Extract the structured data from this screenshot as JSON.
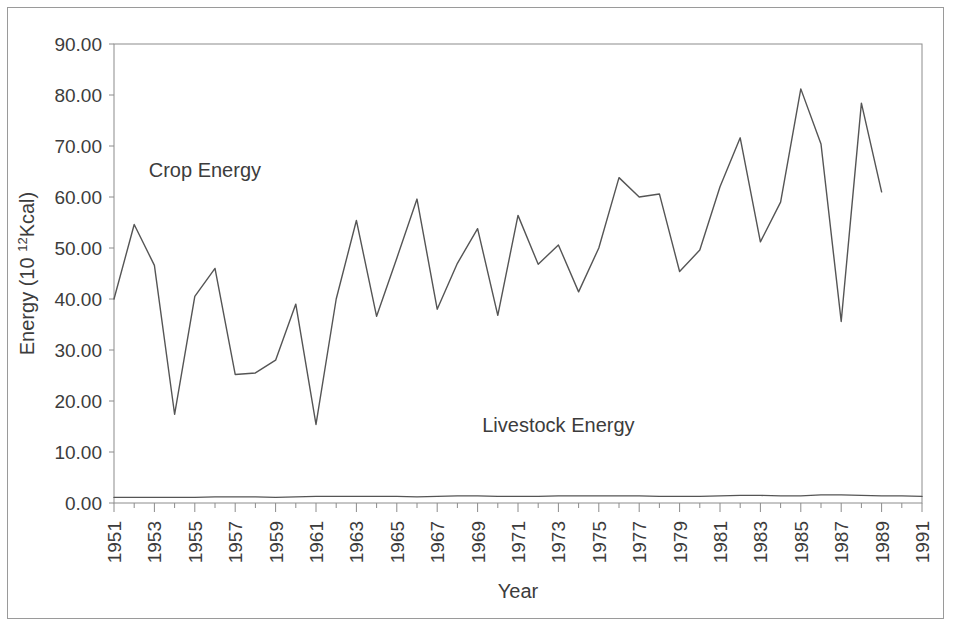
{
  "figure": {
    "frame_color": "#9a9a9a",
    "background": "#ffffff",
    "line_color": "#555555",
    "axis_color": "#8c8c8c",
    "text_color": "#3c3c3c"
  },
  "labels": {
    "crop_series_label": "Crop Energy",
    "livestock_series_label": "Livestock Energy",
    "xlabel": "Year",
    "ylabel_prefix": "Energy (10 ",
    "ylabel_superscript": "12",
    "ylabel_suffix": "Kcal)"
  },
  "chart_data": {
    "type": "line",
    "title": "",
    "xlabel": "Year",
    "ylabel": "Energy (10 12Kcal)",
    "xlim": [
      1951,
      1991
    ],
    "ylim": [
      0,
      90
    ],
    "grid": false,
    "legend": "inline-annotations",
    "ytick_labels": [
      "0.00",
      "10.00",
      "20.00",
      "30.00",
      "40.00",
      "50.00",
      "60.00",
      "70.00",
      "80.00",
      "90.00"
    ],
    "ytick_values": [
      0,
      10,
      20,
      30,
      40,
      50,
      60,
      70,
      80,
      90
    ],
    "xtick_labels": [
      "1951",
      "1953",
      "1955",
      "1957",
      "1959",
      "1961",
      "1963",
      "1965",
      "1967",
      "1969",
      "1971",
      "1973",
      "1975",
      "1977",
      "1979",
      "1981",
      "1983",
      "1985",
      "1987",
      "1989",
      "1991"
    ],
    "xtick_values": [
      1951,
      1953,
      1955,
      1957,
      1959,
      1961,
      1963,
      1965,
      1967,
      1969,
      1971,
      1973,
      1975,
      1977,
      1979,
      1981,
      1983,
      1985,
      1987,
      1989,
      1991
    ],
    "x": [
      1951,
      1952,
      1953,
      1954,
      1955,
      1956,
      1957,
      1958,
      1959,
      1960,
      1961,
      1962,
      1963,
      1964,
      1965,
      1966,
      1967,
      1968,
      1969,
      1970,
      1971,
      1972,
      1973,
      1974,
      1975,
      1976,
      1977,
      1978,
      1979,
      1980,
      1981,
      1982,
      1983,
      1984,
      1985,
      1986,
      1987,
      1988,
      1989,
      1990,
      1991
    ],
    "series": [
      {
        "name": "Crop Energy",
        "values": [
          40.0,
          54.6,
          46.6,
          17.4,
          40.5,
          46.0,
          25.2,
          25.5,
          28.0,
          39.0,
          15.4,
          40.0,
          55.4,
          36.6,
          48.0,
          59.6,
          38.0,
          47.0,
          53.8,
          36.8,
          56.4,
          46.8,
          50.6,
          41.4,
          50.0,
          63.8,
          60.0,
          60.6,
          45.4,
          49.6,
          62.0,
          71.6,
          51.2,
          59.0,
          81.2,
          70.4,
          35.6,
          78.4,
          61.0,
          0,
          0
        ],
        "annotation": "Crop Energy",
        "annotation_x": 1955.5,
        "annotation_y": 64.0
      },
      {
        "name": "Livestock Energy",
        "values": [
          1.1,
          1.1,
          1.1,
          1.1,
          1.1,
          1.2,
          1.2,
          1.2,
          1.1,
          1.2,
          1.3,
          1.3,
          1.3,
          1.3,
          1.3,
          1.2,
          1.3,
          1.4,
          1.4,
          1.3,
          1.3,
          1.3,
          1.4,
          1.4,
          1.4,
          1.4,
          1.4,
          1.3,
          1.3,
          1.3,
          1.4,
          1.5,
          1.5,
          1.4,
          1.4,
          1.6,
          1.6,
          1.5,
          1.4,
          1.4,
          1.3
        ],
        "annotation": "Livestock Energy",
        "annotation_x": 1973.0,
        "annotation_y": 14.0
      }
    ]
  }
}
